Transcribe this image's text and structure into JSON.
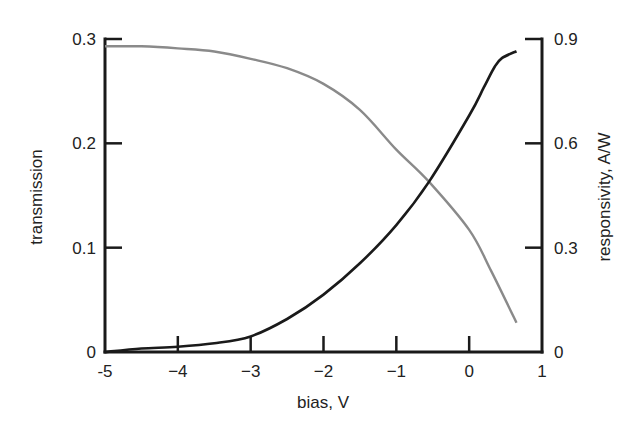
{
  "chart_data": {
    "type": "line",
    "title": "",
    "xlabel": "bias, V",
    "ylabel": "transmission",
    "y2label": "responsivity, A/W",
    "xlim": [
      -5,
      1
    ],
    "ylim": [
      0,
      0.3
    ],
    "y2lim": [
      0,
      0.9
    ],
    "grid": false,
    "legend": "none",
    "x_ticks": [
      "-5",
      "−4",
      "−3",
      "−2",
      "−1",
      "0",
      "1"
    ],
    "x_tick_values": [
      -5,
      -4,
      -3,
      -2,
      -1,
      0,
      1
    ],
    "y_ticks": [
      "0",
      "0.1",
      "0.2",
      "0.3"
    ],
    "y_tick_values": [
      0,
      0.1,
      0.2,
      0.3
    ],
    "y2_ticks": [
      "0",
      "0.3",
      "0.6",
      "0.9"
    ],
    "y2_tick_values": [
      0,
      0.3,
      0.6,
      0.9
    ],
    "series": [
      {
        "name": "transmission",
        "axis": "left",
        "color": "#8a8a8a",
        "x": [
          -5,
          -4.5,
          -4,
          -3.5,
          -3,
          -2.5,
          -2,
          -1.5,
          -1,
          -0.55,
          0,
          0.3,
          0.65
        ],
        "y": [
          0.293,
          0.293,
          0.291,
          0.288,
          0.281,
          0.272,
          0.257,
          0.232,
          0.194,
          0.163,
          0.117,
          0.078,
          0.028
        ]
      },
      {
        "name": "responsivity",
        "axis": "right",
        "color": "#1a1a1a",
        "x": [
          -5,
          -4.5,
          -4,
          -3.5,
          -3,
          -2.5,
          -2,
          -1.5,
          -1,
          -0.55,
          0,
          0.2,
          0.35,
          0.45,
          0.65
        ],
        "y": [
          0.0,
          0.01,
          0.015,
          0.025,
          0.045,
          0.095,
          0.165,
          0.255,
          0.365,
          0.49,
          0.68,
          0.76,
          0.82,
          0.845,
          0.865
        ]
      }
    ]
  }
}
